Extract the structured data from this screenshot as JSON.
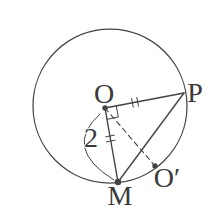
{
  "figure": {
    "labels": {
      "O": "O",
      "P": "P",
      "M": "M",
      "O_prime": "O′",
      "radius": "2"
    },
    "colors": {
      "background": "#ffffff",
      "stroke": "#434343",
      "text": "#3a3a3a"
    },
    "geometry": {
      "circle": {
        "cx": 110,
        "cy": 106,
        "r": 77
      },
      "points": {
        "O": [
          105,
          108
        ],
        "P": [
          184,
          93
        ],
        "M": [
          118,
          182
        ],
        "O_prime": [
          155,
          166
        ]
      },
      "segments": [
        {
          "name": "segment-OP",
          "from": "O",
          "to": "P"
        },
        {
          "name": "segment-OM",
          "from": "O",
          "to": "M"
        },
        {
          "name": "segment-PM",
          "from": "P",
          "to": "M"
        },
        {
          "name": "segment-OO-prime",
          "from": "O",
          "to": "O_prime"
        }
      ],
      "dots": [
        {
          "name": "point-dot-o",
          "point": "O",
          "r": 2.7
        },
        {
          "name": "point-dot-m",
          "point": "M",
          "r": 3.2
        },
        {
          "name": "point-dot-o-prime",
          "point": "O_prime",
          "r": 2.7
        }
      ],
      "right_angle_mark": "M 116.3 105.8 L 118.3 117.1 L 107.0 119.3",
      "radius_brace": "M 100 114 Q 62 148 114 180",
      "tick_marks": [
        {
          "x1": 131.6,
          "y1": 98.5,
          "x2": 133.2,
          "y2": 107.1
        },
        {
          "x1": 136.8,
          "y1": 97.5,
          "x2": 138.4,
          "y2": 106.1
        },
        {
          "x1": 105.7,
          "y1": 136.8,
          "x2": 114.3,
          "y2": 135.2
        },
        {
          "x1": 106.5,
          "y1": 141.8,
          "x2": 115.1,
          "y2": 140.2
        }
      ],
      "label_positions": {
        "point-label-o": {
          "x": 104,
          "y": 103
        },
        "point-label-p": {
          "x": 195,
          "y": 102
        },
        "point-label-m": {
          "x": 120,
          "y": 205
        },
        "point-label-o-prime": {
          "x": 167,
          "y": 187
        },
        "radius-value-label": {
          "x": 91,
          "y": 147
        }
      }
    }
  }
}
